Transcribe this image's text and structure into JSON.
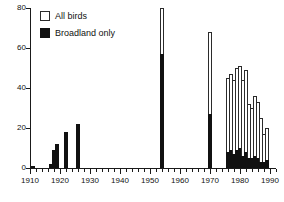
{
  "chart_data": {
    "type": "bar",
    "title": "",
    "subtitle": "",
    "xlabel": "",
    "ylabel": "",
    "xlim": [
      1910,
      1992
    ],
    "ylim": [
      0,
      80
    ],
    "grid": false,
    "stacked": true,
    "legend_position": "top-left",
    "y_ticks": [
      0,
      20,
      40,
      60,
      80
    ],
    "y_tick_labels": [
      "0",
      "20",
      "40",
      "60",
      "80"
    ],
    "x_ticks": [
      1910,
      1920,
      1930,
      1940,
      1950,
      1960,
      1970,
      1980,
      1990
    ],
    "x_tick_labels": [
      "1910",
      "1920",
      "1930",
      "1940",
      "1950",
      "1960",
      "1970",
      "1980",
      "1990"
    ],
    "x_minor_tick_interval": 2,
    "series": [
      {
        "name": "All birds",
        "color": "#ffffff",
        "edge_color": "#2b2b2b",
        "values": [
          1,
          2,
          9,
          12,
          18,
          22,
          80,
          68,
          45,
          47,
          44,
          50,
          51,
          44,
          49,
          32,
          30,
          36,
          33,
          25,
          17,
          20
        ]
      },
      {
        "name": "Broadland only",
        "color": "#111111",
        "edge_color": "#111111",
        "values": [
          1,
          2,
          9,
          12,
          18,
          22,
          57,
          27,
          8,
          9,
          7,
          9,
          10,
          6,
          8,
          5,
          5,
          6,
          5,
          3,
          3,
          4
        ]
      }
    ],
    "x": [
      1911,
      1917,
      1918,
      1919,
      1922,
      1926,
      1954,
      1970,
      1976,
      1977,
      1978,
      1979,
      1980,
      1981,
      1982,
      1983,
      1984,
      1985,
      1986,
      1987,
      1988,
      1989
    ]
  },
  "legend": {
    "items": [
      {
        "label": "All birds",
        "swatch": "open-square"
      },
      {
        "label": "Broadland only",
        "swatch": "filled-square"
      }
    ]
  }
}
